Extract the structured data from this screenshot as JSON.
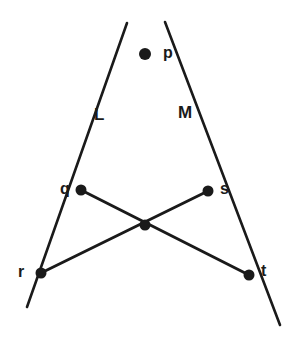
{
  "figure": {
    "title": "",
    "background_color": "#ffffff",
    "stroke_color": "#1a1a1a",
    "node_color": "#1a1a1a",
    "canvas": {
      "width": 292,
      "height": 347
    },
    "point_labels": [
      {
        "id": "p",
        "text": "p",
        "x": 163,
        "y": 45,
        "node_x": 145,
        "node_y": 54
      },
      {
        "id": "q",
        "text": "q",
        "x": 60,
        "y": 181,
        "node_x": 81,
        "node_y": 190
      },
      {
        "id": "s",
        "text": "s",
        "x": 220,
        "y": 181,
        "node_x": 208,
        "node_y": 191
      },
      {
        "id": "r",
        "text": "r",
        "x": 18,
        "y": 264,
        "node_x": 41,
        "node_y": 273
      },
      {
        "id": "t",
        "text": "t",
        "x": 261,
        "y": 263,
        "node_x": 249,
        "node_y": 275
      }
    ],
    "line_labels": [
      {
        "id": "L",
        "text": "L",
        "x": 94,
        "y": 106
      },
      {
        "id": "M",
        "text": "M",
        "x": 178,
        "y": 104
      }
    ],
    "nodes": [
      {
        "id": "p",
        "x": 145,
        "y": 54,
        "r": 6.0,
        "labeled": true
      },
      {
        "id": "q",
        "x": 81,
        "y": 190,
        "r": 5.5,
        "labeled": true
      },
      {
        "id": "s",
        "x": 208,
        "y": 191,
        "r": 5.5,
        "labeled": true
      },
      {
        "id": "r",
        "x": 41,
        "y": 273,
        "r": 5.5,
        "labeled": true
      },
      {
        "id": "t",
        "x": 249,
        "y": 275,
        "r": 5.5,
        "labeled": true
      },
      {
        "id": "center",
        "x": 145,
        "y": 225,
        "r": 5.5,
        "labeled": false
      }
    ],
    "segments": [
      {
        "id": "L-line",
        "name": "line-L",
        "x1": 127,
        "y1": 23,
        "x2": 27,
        "y2": 307,
        "width": 2.6
      },
      {
        "id": "M-line",
        "name": "line-M",
        "x1": 165,
        "y1": 22,
        "x2": 280,
        "y2": 325,
        "width": 2.6
      },
      {
        "id": "q-to-t",
        "name": "segment-q-t",
        "x1": 81,
        "y1": 190,
        "x2": 249,
        "y2": 275,
        "width": 3.0
      },
      {
        "id": "s-to-r",
        "name": "segment-s-r",
        "x1": 208,
        "y1": 191,
        "x2": 41,
        "y2": 273,
        "width": 3.0
      }
    ]
  }
}
